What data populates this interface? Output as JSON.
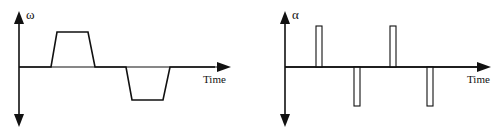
{
  "diagrams": [
    {
      "id": "angular-velocity",
      "y_label": "ω",
      "x_label": "Time",
      "origin": [
        19,
        67
      ],
      "y_axis": {
        "top": 12,
        "bottom": 126
      },
      "x_axis": {
        "right": 230
      },
      "waveform": "0,67 51,67 57,32 88,32 95,67 126,67 132,100 163,100 170,67 222,67",
      "label_pos": {
        "y_label": [
          27,
          18
        ],
        "x_label": [
          203,
          84
        ]
      }
    },
    {
      "id": "angular-acceleration",
      "y_label": "α",
      "x_label": "Time",
      "origin": [
        285,
        67
      ],
      "y_axis": {
        "top": 12,
        "bottom": 126
      },
      "x_axis": {
        "right": 491
      },
      "pulses": [
        {
          "x": 316,
          "w": 6,
          "y1": 26,
          "y2": 67,
          "dir": "up"
        },
        {
          "x": 354,
          "w": 6,
          "y1": 67,
          "y2": 106,
          "dir": "down"
        },
        {
          "x": 390,
          "w": 6,
          "y1": 26,
          "y2": 67,
          "dir": "up"
        },
        {
          "x": 427,
          "w": 6,
          "y1": 67,
          "y2": 106,
          "dir": "down"
        }
      ],
      "label_pos": {
        "y_label": [
          292,
          18
        ],
        "x_label": [
          467,
          84
        ]
      }
    }
  ],
  "colors": {
    "line": "#111111",
    "background": "#ffffff"
  }
}
